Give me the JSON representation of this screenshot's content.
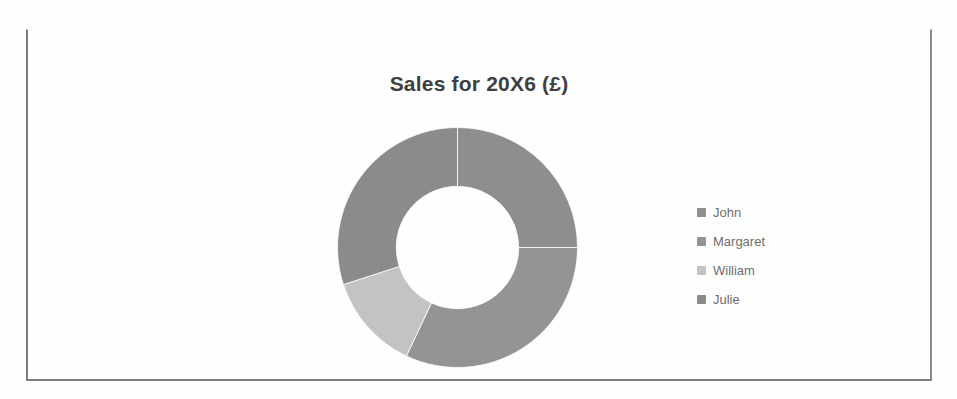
{
  "chart_data": {
    "type": "pie",
    "variant": "doughnut",
    "title": "Sales for 20X6 (£)",
    "xlabel": "",
    "ylabel": "",
    "categories": [
      "John",
      "Margaret",
      "William",
      "Julie"
    ],
    "values": [
      25,
      32,
      13,
      30
    ],
    "unit": "%",
    "currency_symbol": "£",
    "period": "20X6",
    "legend_position": "right",
    "grid": false,
    "data_labels": false,
    "inner_radius_ratio": 0.51,
    "start_angle_deg": 0,
    "direction": "clockwise",
    "slice_colors": [
      "#8e8e8e",
      "#949494",
      "#c3c3c3",
      "#8b8b8b"
    ]
  },
  "chart": {
    "title": "Sales for 20X6 (£)",
    "border_color": "#7c7c7c",
    "plot_background": "#ffffff"
  },
  "legend": {
    "items": [
      {
        "label": "John",
        "color": "#8e8e8e"
      },
      {
        "label": "Margaret",
        "color": "#949494"
      },
      {
        "label": "William",
        "color": "#c3c3c3"
      },
      {
        "label": "Julie",
        "color": "#8b8b8b"
      }
    ]
  }
}
